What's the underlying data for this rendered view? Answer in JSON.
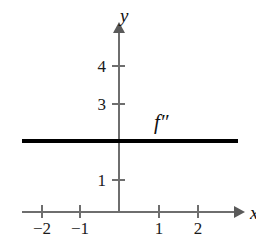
{
  "chart_data": {
    "type": "line",
    "title": "",
    "xlabel": "x",
    "ylabel": "y",
    "xlim": [
      -2.5,
      3.05
    ],
    "ylim": [
      -0.55,
      4.9
    ],
    "grid": false,
    "legend": "none",
    "x_ticks": [
      {
        "value": -2,
        "label": "−2",
        "px": 42
      },
      {
        "value": -1,
        "label": "−1",
        "px": 80
      },
      {
        "value": 1,
        "label": "1",
        "px": 159
      },
      {
        "value": 2,
        "label": "2",
        "px": 198
      }
    ],
    "y_ticks": [
      {
        "value": 4,
        "label": "4",
        "px": 66
      },
      {
        "value": 3,
        "label": "3",
        "px": 104
      },
      {
        "value": 1,
        "label": "1",
        "px": 180
      }
    ],
    "series": [
      {
        "name": "f″",
        "annotation": "f″",
        "kind": "horizontal-line",
        "constant_y": 2,
        "x": [
          -2.5,
          3.05
        ],
        "values": [
          2,
          2
        ],
        "color": "#000000",
        "linewidth": 4
      }
    ],
    "annotations": [
      {
        "text": "f″",
        "x": 0.95,
        "y": 2.45
      },
      {
        "text": "y",
        "x": 0.05,
        "y": 4.85
      },
      {
        "text": "x",
        "x": 3.05,
        "y": 0.0
      }
    ],
    "axis_color": "#6e6e6e",
    "text_color": "#1a1a1a",
    "background": "#ffffff"
  }
}
